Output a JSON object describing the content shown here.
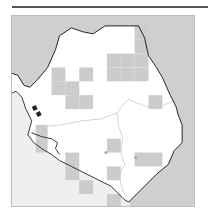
{
  "map": {
    "title": "",
    "region": "Sierra Leone",
    "colors": {
      "sea": "#efefef",
      "neighbor_land": "#cfcfcf",
      "country_fill": "#ffffff",
      "grid_cell": "#cccccc",
      "border": "#222222",
      "internal_boundary": "#c8c8c8",
      "frame": "#bdbdbd",
      "top_rule": "#555555"
    },
    "grid_cells": [
      {
        "x": 40,
        "y": 52,
        "w": 14,
        "h": 14
      },
      {
        "x": 40,
        "y": 66,
        "w": 14,
        "h": 14
      },
      {
        "x": 54,
        "y": 66,
        "w": 14,
        "h": 14
      },
      {
        "x": 54,
        "y": 80,
        "w": 14,
        "h": 14
      },
      {
        "x": 68,
        "y": 52,
        "w": 14,
        "h": 14
      },
      {
        "x": 68,
        "y": 80,
        "w": 14,
        "h": 14
      },
      {
        "x": 96,
        "y": 38,
        "w": 14,
        "h": 14
      },
      {
        "x": 110,
        "y": 38,
        "w": 14,
        "h": 14
      },
      {
        "x": 124,
        "y": 38,
        "w": 14,
        "h": 14
      },
      {
        "x": 96,
        "y": 52,
        "w": 14,
        "h": 14
      },
      {
        "x": 110,
        "y": 52,
        "w": 14,
        "h": 14
      },
      {
        "x": 124,
        "y": 52,
        "w": 14,
        "h": 14
      },
      {
        "x": 124,
        "y": 10,
        "w": 14,
        "h": 14
      },
      {
        "x": 124,
        "y": 24,
        "w": 14,
        "h": 14
      },
      {
        "x": 138,
        "y": 80,
        "w": 14,
        "h": 14
      },
      {
        "x": 24,
        "y": 110,
        "w": 12,
        "h": 14
      },
      {
        "x": 24,
        "y": 124,
        "w": 12,
        "h": 14
      },
      {
        "x": 54,
        "y": 152,
        "w": 14,
        "h": 14
      },
      {
        "x": 54,
        "y": 138,
        "w": 14,
        "h": 14
      },
      {
        "x": 68,
        "y": 166,
        "w": 14,
        "h": 14
      },
      {
        "x": 96,
        "y": 124,
        "w": 14,
        "h": 14
      },
      {
        "x": 96,
        "y": 152,
        "w": 14,
        "h": 14
      },
      {
        "x": 96,
        "y": 180,
        "w": 14,
        "h": 14
      },
      {
        "x": 124,
        "y": 138,
        "w": 28,
        "h": 14
      }
    ],
    "markers": [
      {
        "x": 95,
        "y": 138
      },
      {
        "x": 125,
        "y": 143
      }
    ]
  }
}
